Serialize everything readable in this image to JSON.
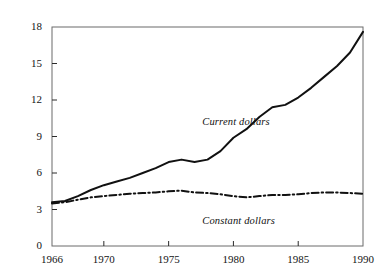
{
  "chart_data": {
    "type": "line",
    "title": "",
    "xlabel": "",
    "ylabel": "",
    "xlim": [
      1966,
      1990
    ],
    "ylim": [
      0,
      18
    ],
    "grid": false,
    "legend_position": "inline-annotation",
    "x": [
      1966,
      1967,
      1968,
      1969,
      1970,
      1971,
      1972,
      1973,
      1974,
      1975,
      1976,
      1977,
      1978,
      1979,
      1980,
      1981,
      1982,
      1983,
      1984,
      1985,
      1986,
      1987,
      1988,
      1989,
      1990
    ],
    "xticks": [
      1966,
      1970,
      1975,
      1980,
      1985,
      1990
    ],
    "xtick_labels": [
      "1966",
      "1970",
      "1975",
      "1980",
      "1985",
      "1990"
    ],
    "yticks": [
      0,
      3,
      6,
      9,
      12,
      15,
      18
    ],
    "ytick_labels": [
      "0",
      "3",
      "6",
      "9",
      "12",
      "15",
      "18"
    ],
    "series": [
      {
        "name": "Current dollars",
        "style": "solid",
        "color": "#111111",
        "label": "Current dollars",
        "label_x": 1977.6,
        "label_y": 10.6,
        "values": [
          3.6,
          3.7,
          4.1,
          4.6,
          5.0,
          5.3,
          5.6,
          6.0,
          6.4,
          6.9,
          7.1,
          6.9,
          7.1,
          7.8,
          8.9,
          9.6,
          10.6,
          11.4,
          11.6,
          12.2,
          13.0,
          13.9,
          14.8,
          15.9,
          17.6
        ]
      },
      {
        "name": "Constant dollars",
        "style": "dash-dot",
        "color": "#111111",
        "label": "Constant dollars",
        "label_x": 1977.6,
        "label_y": 2.5,
        "values": [
          3.5,
          3.6,
          3.8,
          4.0,
          4.1,
          4.2,
          4.3,
          4.35,
          4.4,
          4.5,
          4.55,
          4.4,
          4.35,
          4.25,
          4.1,
          4.0,
          4.1,
          4.2,
          4.2,
          4.25,
          4.35,
          4.4,
          4.4,
          4.35,
          4.3
        ]
      }
    ]
  },
  "axes": {
    "frame_color": "#4a4a4a",
    "tick_color": "#2a2a2a"
  }
}
